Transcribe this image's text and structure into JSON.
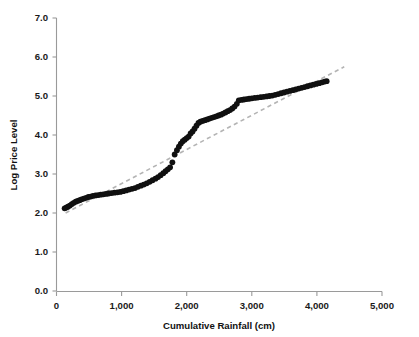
{
  "chart_data": {
    "type": "scatter",
    "title": "",
    "xlabel": "Cumulative Rainfall (cm)",
    "ylabel": "Log Price Level",
    "xlim": [
      0,
      5000
    ],
    "ylim": [
      0.0,
      7.0
    ],
    "xticks": [
      0,
      1000,
      2000,
      3000,
      4000,
      5000
    ],
    "xtick_labels": [
      "0",
      "1,000",
      "2,000",
      "3,000",
      "4,000",
      "5,000"
    ],
    "yticks": [
      0.0,
      1.0,
      2.0,
      3.0,
      4.0,
      5.0,
      6.0,
      7.0
    ],
    "ytick_labels": [
      "0.0",
      "1.0",
      "2.0",
      "3.0",
      "4.0",
      "5.0",
      "6.0",
      "7.0"
    ],
    "grid": false,
    "legend": "none",
    "series": [
      {
        "name": "Observed log price level",
        "marker": "filled-circle",
        "color": "#101010",
        "points": [
          [
            125,
            2.12
          ],
          [
            150,
            2.14
          ],
          [
            175,
            2.16
          ],
          [
            205,
            2.19
          ],
          [
            235,
            2.23
          ],
          [
            265,
            2.26
          ],
          [
            295,
            2.29
          ],
          [
            325,
            2.31
          ],
          [
            355,
            2.33
          ],
          [
            385,
            2.35
          ],
          [
            420,
            2.37
          ],
          [
            455,
            2.39
          ],
          [
            490,
            2.41
          ],
          [
            525,
            2.42
          ],
          [
            560,
            2.44
          ],
          [
            600,
            2.45
          ],
          [
            640,
            2.46
          ],
          [
            680,
            2.47
          ],
          [
            720,
            2.48
          ],
          [
            760,
            2.49
          ],
          [
            800,
            2.5
          ],
          [
            845,
            2.51
          ],
          [
            890,
            2.52
          ],
          [
            935,
            2.53
          ],
          [
            980,
            2.54
          ],
          [
            1025,
            2.56
          ],
          [
            1070,
            2.58
          ],
          [
            1115,
            2.6
          ],
          [
            1160,
            2.62
          ],
          [
            1205,
            2.64
          ],
          [
            1250,
            2.67
          ],
          [
            1295,
            2.7
          ],
          [
            1340,
            2.73
          ],
          [
            1385,
            2.76
          ],
          [
            1430,
            2.8
          ],
          [
            1475,
            2.84
          ],
          [
            1520,
            2.88
          ],
          [
            1560,
            2.92
          ],
          [
            1600,
            2.97
          ],
          [
            1640,
            3.02
          ],
          [
            1675,
            3.07
          ],
          [
            1710,
            3.12
          ],
          [
            1745,
            3.17
          ],
          [
            1780,
            3.3
          ],
          [
            1815,
            3.5
          ],
          [
            1850,
            3.61
          ],
          [
            1880,
            3.7
          ],
          [
            1910,
            3.78
          ],
          [
            1940,
            3.84
          ],
          [
            1970,
            3.88
          ],
          [
            2000,
            3.92
          ],
          [
            2030,
            3.96
          ],
          [
            2060,
            4.04
          ],
          [
            2090,
            4.09
          ],
          [
            2120,
            4.16
          ],
          [
            2150,
            4.24
          ],
          [
            2180,
            4.31
          ],
          [
            2210,
            4.34
          ],
          [
            2245,
            4.36
          ],
          [
            2280,
            4.38
          ],
          [
            2315,
            4.4
          ],
          [
            2350,
            4.42
          ],
          [
            2385,
            4.44
          ],
          [
            2420,
            4.46
          ],
          [
            2455,
            4.48
          ],
          [
            2490,
            4.5
          ],
          [
            2525,
            4.52
          ],
          [
            2560,
            4.55
          ],
          [
            2595,
            4.58
          ],
          [
            2630,
            4.61
          ],
          [
            2665,
            4.64
          ],
          [
            2700,
            4.68
          ],
          [
            2735,
            4.73
          ],
          [
            2770,
            4.8
          ],
          [
            2800,
            4.89
          ],
          [
            2840,
            4.9
          ],
          [
            2880,
            4.91
          ],
          [
            2920,
            4.92
          ],
          [
            2960,
            4.93
          ],
          [
            3000,
            4.94
          ],
          [
            3045,
            4.95
          ],
          [
            3090,
            4.96
          ],
          [
            3135,
            4.97
          ],
          [
            3180,
            4.98
          ],
          [
            3225,
            4.99
          ],
          [
            3270,
            5.0
          ],
          [
            3315,
            5.01
          ],
          [
            3360,
            5.03
          ],
          [
            3405,
            5.05
          ],
          [
            3450,
            5.07
          ],
          [
            3495,
            5.09
          ],
          [
            3540,
            5.11
          ],
          [
            3585,
            5.13
          ],
          [
            3630,
            5.15
          ],
          [
            3675,
            5.17
          ],
          [
            3720,
            5.19
          ],
          [
            3765,
            5.21
          ],
          [
            3810,
            5.23
          ],
          [
            3855,
            5.25
          ],
          [
            3900,
            5.27
          ],
          [
            3945,
            5.29
          ],
          [
            3990,
            5.31
          ],
          [
            4035,
            5.33
          ],
          [
            4080,
            5.35
          ],
          [
            4120,
            5.37
          ],
          [
            4150,
            5.38
          ]
        ]
      }
    ],
    "trendline": {
      "name": "Fitted trend (dashed)",
      "style": "dashed",
      "color": "#b4b4b4",
      "x_start": 140,
      "y_start": 2.0,
      "x_end": 4420,
      "y_end": 5.75
    }
  },
  "axes": {
    "x_axis_name": "Cumulative Rainfall (cm)",
    "y_axis_name": "Log Price Level"
  }
}
